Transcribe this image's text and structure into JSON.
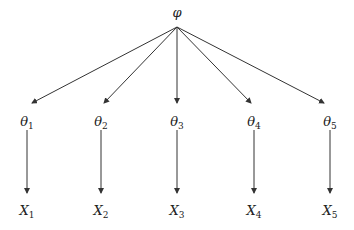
{
  "diagram": {
    "root": {
      "symbol": "φ",
      "x": 177,
      "y": 6
    },
    "theta_nodes": [
      {
        "symbol": "θ",
        "sub": "1",
        "x": 27
      },
      {
        "symbol": "θ",
        "sub": "2",
        "x": 101
      },
      {
        "symbol": "θ",
        "sub": "3",
        "x": 177
      },
      {
        "symbol": "θ",
        "sub": "4",
        "x": 254
      },
      {
        "symbol": "θ",
        "sub": "5",
        "x": 330
      }
    ],
    "x_nodes": [
      {
        "symbol": "X",
        "sub": "1",
        "x": 27
      },
      {
        "symbol": "X",
        "sub": "2",
        "x": 101
      },
      {
        "symbol": "X",
        "sub": "3",
        "x": 177
      },
      {
        "symbol": "X",
        "sub": "4",
        "x": 254
      },
      {
        "symbol": "X",
        "sub": "5",
        "x": 330
      }
    ],
    "edge_color": "#333333"
  }
}
